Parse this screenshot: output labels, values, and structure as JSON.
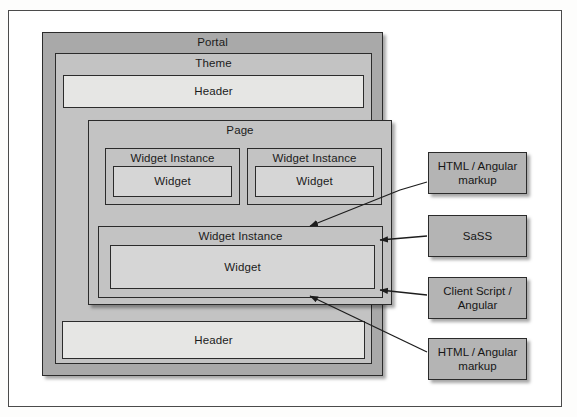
{
  "diagram": {
    "colors": {
      "portal_fill": "#a9a9a9",
      "theme_fill": "#c3c3c3",
      "page_fill": "#c3c3c3",
      "widget_instance_fill": "#c3c3c3",
      "widget_fill": "#d6d6d6",
      "header_fill": "#e6e6e4",
      "note_fill": "#b4b4b4",
      "stroke": "#2b2b2b",
      "frame_stroke": "#4b4b4b"
    },
    "containers": {
      "portal": {
        "label": "Portal"
      },
      "theme": {
        "label": "Theme"
      },
      "header_top": {
        "label": "Header"
      },
      "header_bottom": {
        "label": "Header"
      },
      "page": {
        "label": "Page"
      }
    },
    "widget_instances": [
      {
        "label": "Widget Instance",
        "widget_label": "Widget"
      },
      {
        "label": "Widget Instance",
        "widget_label": "Widget"
      },
      {
        "label": "Widget Instance",
        "widget_label": "Widget"
      }
    ],
    "notes": [
      {
        "label": "HTML / Angular markup"
      },
      {
        "label": "SaSS"
      },
      {
        "label": "Client Script / Angular"
      },
      {
        "label": "HTML / Angular markup"
      }
    ]
  }
}
